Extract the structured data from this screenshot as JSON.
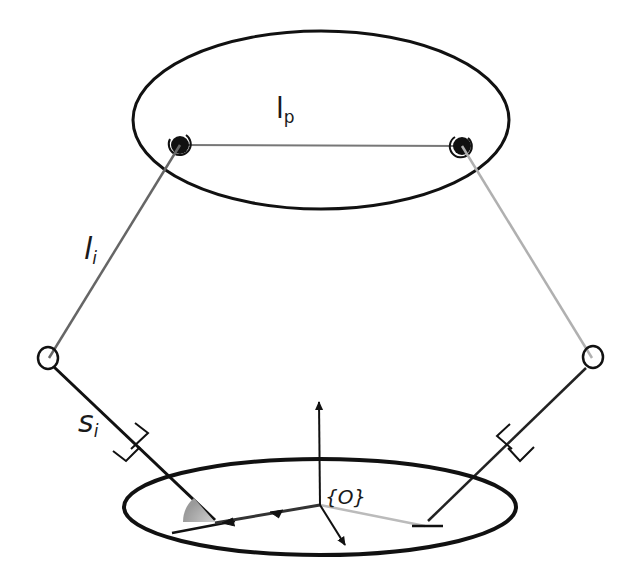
{
  "diagram": {
    "type": "parallel-robot-kinematic-schematic",
    "labels": {
      "platform_length_main": "l",
      "platform_length_sub": "p",
      "leg_length_main": "l",
      "leg_length_sub": "i",
      "slider_main": "s",
      "slider_sub": "i",
      "origin_frame": "{O}"
    },
    "components": {
      "top_platform": "ellipse (moving platform)",
      "base_platform": "ellipse (fixed base)",
      "spherical_joints": 2,
      "passive_joints": 2,
      "prismatic_guides": 2
    },
    "colors": {
      "stroke": "#111111",
      "leg_gray": "#888888",
      "leg_light": "#b5b5b5",
      "angle_fill": "#a8a8a8"
    }
  }
}
